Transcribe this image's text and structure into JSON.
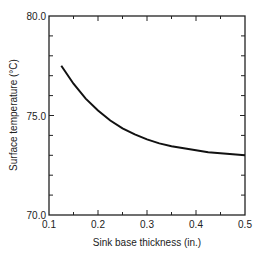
{
  "chart_data": {
    "type": "line",
    "title": "",
    "xlabel": "Sink base thickness (in.)",
    "ylabel": "Surface temperature (°C)",
    "xlim": [
      0.1,
      0.5
    ],
    "ylim": [
      70.0,
      80.0
    ],
    "x_ticks": [
      "0.1",
      "0.2",
      "0.3",
      "0.4",
      "0.5"
    ],
    "y_ticks": [
      "70.0",
      "75.0",
      "80.0"
    ],
    "grid": false,
    "legend": null,
    "series": [
      {
        "name": "Surface temperature",
        "x": [
          0.125,
          0.15,
          0.175,
          0.2,
          0.225,
          0.25,
          0.275,
          0.3,
          0.325,
          0.35,
          0.375,
          0.4,
          0.425,
          0.45,
          0.475,
          0.5
        ],
        "values": [
          77.5,
          76.6,
          75.85,
          75.25,
          74.75,
          74.35,
          74.05,
          73.8,
          73.6,
          73.45,
          73.35,
          73.25,
          73.15,
          73.1,
          73.05,
          73.0
        ]
      }
    ]
  },
  "axes": {
    "x_label": "Sink base thickness (in.)",
    "y_label": "Surface temperature (°C)",
    "x_tick_labels": [
      "0.1",
      "0.2",
      "0.3",
      "0.4",
      "0.5"
    ],
    "y_tick_labels": [
      "70.0",
      "75.0",
      "80.0"
    ]
  }
}
